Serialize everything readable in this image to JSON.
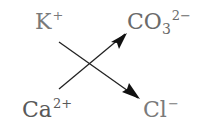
{
  "diagram": {
    "type": "ion-exchange-cross",
    "ions": {
      "top_left": {
        "symbol": "K",
        "charge": "+",
        "subscript": ""
      },
      "top_right": {
        "symbol": "CO",
        "subscript": "3",
        "charge": "2−"
      },
      "bottom_left": {
        "symbol": "Ca",
        "charge": "2+",
        "subscript": ""
      },
      "bottom_right": {
        "symbol": "Cl",
        "charge": "−",
        "subscript": ""
      }
    },
    "arrows": [
      {
        "from": "top_left",
        "to": "bottom_right"
      },
      {
        "from": "bottom_left",
        "to": "top_right"
      }
    ],
    "colors": {
      "k_text": "#7a7a7a",
      "co3_text": "#6a6a6a",
      "ca_text": "#595959",
      "cl_text": "#7a7a7a",
      "arrow": "#111111"
    }
  }
}
